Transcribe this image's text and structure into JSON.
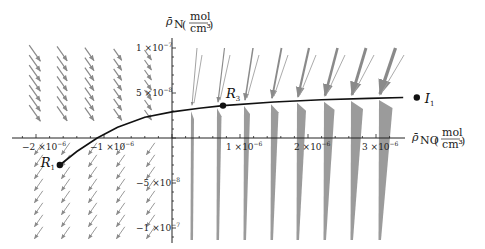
{
  "chart_data": {
    "type": "vector_field_with_trajectory",
    "title": "",
    "xlabel": "ρ̄_NO (mol/cm³)",
    "ylabel": "ρ̄_N (mol/cm³)",
    "x_axis": {
      "symbol": "ρ̄",
      "subscript": "NO",
      "unit_num": "mol",
      "unit_den": "cm³",
      "range": [
        -2.3e-06,
        3.4e-06
      ],
      "ticks": [
        {
          "value": -2e-06,
          "label_main": "−2 ×10",
          "label_exp": "−6"
        },
        {
          "value": -1e-06,
          "label_main": "−1 ×10",
          "label_exp": "−6"
        },
        {
          "value": 1e-06,
          "label_main": "1 ×10",
          "label_exp": "−6"
        },
        {
          "value": 2e-06,
          "label_main": "2 ×10",
          "label_exp": "−6"
        },
        {
          "value": 3e-06,
          "label_main": "3 ×10",
          "label_exp": "−6"
        }
      ]
    },
    "y_axis": {
      "symbol": "ρ̄",
      "subscript": "N",
      "unit_num": "mol",
      "unit_den": "cm³",
      "range": [
        -1.15e-07,
        1.1e-07
      ],
      "ticks": [
        {
          "value": 1e-07,
          "label_main": "1 ×10",
          "label_exp": "−7"
        },
        {
          "value": 5e-08,
          "label_main": "5 ×10",
          "label_exp": "−8"
        },
        {
          "value": -5e-08,
          "label_main": "−5 ×10",
          "label_exp": "−8"
        },
        {
          "value": -1e-07,
          "label_main": "−1 ×10",
          "label_exp": "−7"
        }
      ]
    },
    "points": [
      {
        "name": "R",
        "sub": "1",
        "x": -1.65e-06,
        "y": -3e-08
      },
      {
        "name": "R",
        "sub": "3",
        "x": 7.5e-07,
        "y": 3.6e-08
      },
      {
        "name": "I",
        "sub": "1",
        "x": 3.6e-06,
        "y": 4.5e-08
      }
    ],
    "trajectory": {
      "description": "Curve from R1 through R3 toward I1",
      "x": [
        -1.65e-06,
        -1.4e-06,
        -1.1e-06,
        -8e-07,
        -4e-07,
        0,
        4e-07,
        7.5e-07,
        1.5e-06,
        2.2e-06,
        2.9e-06,
        3.4e-06
      ],
      "y": [
        -3e-08,
        -1.5e-08,
        0,
        1.2e-08,
        2.3e-08,
        2.9e-08,
        3.3e-08,
        3.6e-08,
        4e-08,
        4.25e-08,
        4.4e-08,
        4.5e-08
      ]
    },
    "vector_field": {
      "color": "#8a8a8a",
      "description": "Gray arrows: diagonal down-right on the left (x<-0.5e-6), near-vertical columns for x>0, converging toward the curve; arrows above the curve point down, below point up."
    },
    "grid": false,
    "legend": null
  }
}
